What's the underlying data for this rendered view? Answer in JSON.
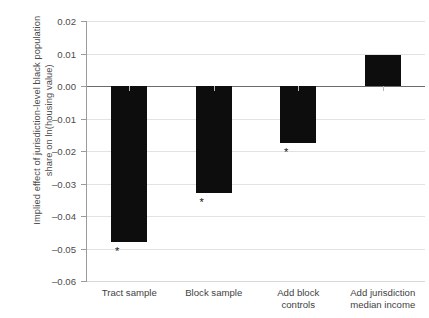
{
  "chart_data": {
    "type": "bar",
    "title": "",
    "xlabel": "",
    "ylabel": "Implied effect of jurisdiction-level black population share on ln(housing value)",
    "ylabel_lines": [
      "Implied effect of jurisdiction-level black population",
      "share on ln(housing value)"
    ],
    "categories": [
      "Tract sample",
      "Block sample",
      "Add block controls",
      "Add jurisdiction median income"
    ],
    "category_lines": [
      [
        "Tract sample"
      ],
      [
        "Block sample"
      ],
      [
        "Add block",
        "controls"
      ],
      [
        "Add jurisdiction",
        "median income"
      ]
    ],
    "values": [
      -0.048,
      -0.033,
      -0.0175,
      0.0095
    ],
    "significance": [
      "*",
      "*",
      "*",
      ""
    ],
    "ylim": [
      -0.06,
      0.02
    ],
    "ytick_values": [
      0.02,
      0.01,
      0.0,
      -0.01,
      -0.02,
      -0.03,
      -0.04,
      -0.05,
      -0.06
    ],
    "ytick_labels": [
      "0.02",
      "0.01",
      "0.00",
      "–0.01",
      "–0.02",
      "–0.03",
      "–0.04",
      "–0.05",
      "–0.06"
    ],
    "grid": true,
    "legend": "none",
    "bar_color": "#0d0d0d",
    "grid_color": "#e2e2e2",
    "zero_line_color": "#6b6b6b",
    "axis_color": "#9b9b9b",
    "text_color": "#3f3f3f"
  }
}
